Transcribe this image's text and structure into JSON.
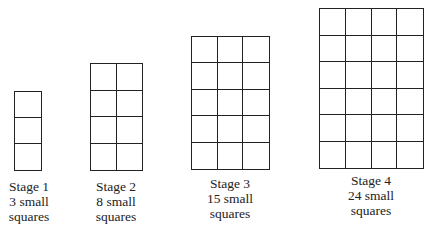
{
  "stages": [
    {
      "title": "Stage 1",
      "count_line": "3 small",
      "unit": "squares",
      "cols": 1,
      "rows": 3,
      "count": 3
    },
    {
      "title": "Stage 2",
      "count_line": "8 small",
      "unit": "squares",
      "cols": 2,
      "rows": 4,
      "count": 8
    },
    {
      "title": "Stage 3",
      "count_line": "15 small",
      "unit": "squares",
      "cols": 3,
      "rows": 5,
      "count": 15
    },
    {
      "title": "Stage 4",
      "count_line": "24 small",
      "unit": "squares",
      "cols": 4,
      "rows": 6,
      "count": 24
    }
  ],
  "colors": {
    "line": "#222222",
    "background": "#ffffff"
  }
}
